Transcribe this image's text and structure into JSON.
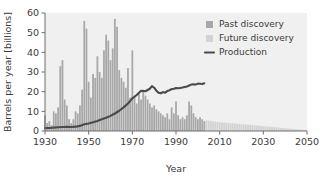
{
  "chart_data": {
    "type": "bar",
    "title": "",
    "xlabel": "Year",
    "ylabel": "Barrels per year [billions]",
    "xlim": [
      1930,
      2050
    ],
    "ylim": [
      0,
      60
    ],
    "xticks": [
      1930,
      1950,
      1970,
      1990,
      2010,
      2030,
      2050
    ],
    "yticks": [
      0,
      10,
      20,
      30,
      40,
      50,
      60
    ],
    "grid": false,
    "legend_position": "top-right",
    "legend": [
      {
        "label": "Past discovery",
        "type": "swatch",
        "color": "#a8a8a8"
      },
      {
        "label": "Future discovery",
        "type": "swatch",
        "color": "#d2d2d2"
      },
      {
        "label": "Production",
        "type": "line",
        "color": "#4a4a4a"
      }
    ],
    "past_future_split_year": 2004,
    "series": [
      {
        "name": "Past discovery",
        "type": "bar",
        "color": "#a8a8a8",
        "x": [
          1930,
          1931,
          1932,
          1933,
          1934,
          1935,
          1936,
          1937,
          1938,
          1939,
          1940,
          1941,
          1942,
          1943,
          1944,
          1945,
          1946,
          1947,
          1948,
          1949,
          1950,
          1951,
          1952,
          1953,
          1954,
          1955,
          1956,
          1957,
          1958,
          1959,
          1960,
          1961,
          1962,
          1963,
          1964,
          1965,
          1966,
          1967,
          1968,
          1969,
          1970,
          1971,
          1972,
          1973,
          1974,
          1975,
          1976,
          1977,
          1978,
          1979,
          1980,
          1981,
          1982,
          1983,
          1984,
          1985,
          1986,
          1987,
          1988,
          1989,
          1990,
          1991,
          1992,
          1993,
          1994,
          1995,
          1996,
          1997,
          1998,
          1999,
          2000,
          2001,
          2002,
          2003
        ],
        "values": [
          8,
          4,
          5,
          3,
          10,
          9,
          12,
          33,
          36,
          16,
          13,
          6,
          4,
          6,
          10,
          9,
          13,
          21,
          56,
          52,
          25,
          17,
          29,
          27,
          38,
          30,
          27,
          41,
          49,
          46,
          36,
          42,
          57,
          53,
          31,
          27,
          25,
          22,
          32,
          17,
          41,
          18,
          14,
          19,
          16,
          21,
          18,
          16,
          14,
          12,
          13,
          11,
          10,
          9,
          8,
          7,
          9,
          6,
          12,
          9,
          15,
          8,
          6,
          7,
          6,
          8,
          15,
          13,
          9,
          7,
          6,
          7,
          6,
          5
        ]
      },
      {
        "name": "Future discovery",
        "type": "bar",
        "color": "#d2d2d2",
        "x": [
          2004,
          2005,
          2006,
          2007,
          2008,
          2009,
          2010,
          2011,
          2012,
          2013,
          2014,
          2015,
          2016,
          2017,
          2018,
          2019,
          2020,
          2021,
          2022,
          2023,
          2024,
          2025,
          2026,
          2027,
          2028,
          2029,
          2030,
          2031,
          2032,
          2033,
          2034,
          2035,
          2036,
          2037,
          2038,
          2039,
          2040,
          2041,
          2042,
          2043,
          2044,
          2045,
          2046,
          2047,
          2048,
          2049,
          2050
        ],
        "values": [
          5.4,
          5.2,
          5.0,
          4.9,
          4.7,
          4.6,
          4.5,
          4.4,
          4.3,
          4.2,
          4.1,
          4.0,
          3.9,
          3.8,
          3.7,
          3.6,
          3.5,
          3.4,
          3.3,
          3.2,
          3.1,
          3.0,
          2.9,
          2.8,
          2.7,
          2.6,
          2.5,
          2.4,
          2.3,
          2.2,
          2.1,
          2.0,
          1.9,
          1.8,
          1.6,
          1.5,
          1.4,
          1.3,
          1.2,
          1.1,
          1.0,
          0.9,
          0.8,
          0.7,
          0.6,
          0.4,
          0.3
        ]
      },
      {
        "name": "Production",
        "type": "line",
        "color": "#4a4a4a",
        "x": [
          1930,
          1932,
          1934,
          1936,
          1938,
          1940,
          1942,
          1944,
          1946,
          1948,
          1950,
          1952,
          1954,
          1956,
          1958,
          1960,
          1962,
          1964,
          1966,
          1968,
          1970,
          1972,
          1974,
          1976,
          1978,
          1979,
          1980,
          1981,
          1982,
          1983,
          1984,
          1985,
          1986,
          1987,
          1988,
          1989,
          1990,
          1991,
          1992,
          1993,
          1994,
          1995,
          1996,
          1997,
          1998,
          1999,
          2000,
          2001,
          2002,
          2003
        ],
        "values": [
          1.5,
          1.5,
          1.7,
          1.9,
          2.0,
          2.1,
          2.0,
          2.2,
          2.6,
          3.4,
          3.8,
          4.4,
          5.1,
          6.0,
          6.7,
          7.7,
          8.9,
          10.3,
          12.0,
          14.0,
          16.6,
          18.3,
          20.5,
          20.2,
          21.5,
          22.8,
          22.0,
          20.5,
          19.5,
          19.2,
          19.8,
          19.5,
          20.3,
          20.7,
          21.3,
          21.5,
          21.8,
          21.7,
          21.9,
          22.1,
          22.4,
          22.6,
          23.1,
          23.6,
          23.8,
          23.6,
          24.1,
          24.0,
          23.9,
          24.3
        ]
      }
    ]
  }
}
